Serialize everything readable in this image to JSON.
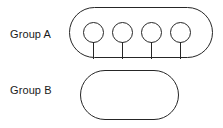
{
  "diagram": {
    "background_color": "#ffffff",
    "line_color": "#262626",
    "groups": [
      {
        "id": "group-a",
        "label": "Group A",
        "item_count": 4,
        "items": [
          {
            "name": "pin-1",
            "icon": "lollipop-pin-icon"
          },
          {
            "name": "pin-2",
            "icon": "lollipop-pin-icon"
          },
          {
            "name": "pin-3",
            "icon": "lollipop-pin-icon"
          },
          {
            "name": "pin-4",
            "icon": "lollipop-pin-icon"
          }
        ]
      },
      {
        "id": "group-b",
        "label": "Group B",
        "item_count": 3,
        "items": [
          {
            "name": "pin-1",
            "icon": "lollipop-pin-icon"
          },
          {
            "name": "pin-2",
            "icon": "lollipop-pin-icon"
          },
          {
            "name": "pin-3",
            "icon": "lollipop-pin-icon"
          }
        ]
      }
    ]
  }
}
